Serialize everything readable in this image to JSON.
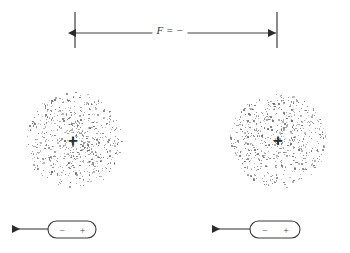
{
  "figure": {
    "background_color": "#ffffff",
    "ink_color": "#3a3a3a",
    "width": 350,
    "height": 253
  },
  "force_annotation": {
    "label": "F = −",
    "arrow_y": 33,
    "left_x": 75,
    "right_x": 277,
    "tick_top_y": 12,
    "tick_bottom_y": 48,
    "label_x": 170,
    "label_y": 30,
    "style": "double-headed-arrow-with-end-ticks"
  },
  "clouds": [
    {
      "name": "left-electron-cloud",
      "cx": 73,
      "cy": 140,
      "radius": 48,
      "dot_count": 620,
      "nucleus_symbol": "+",
      "nucleus_x": 73,
      "nucleus_y": 140,
      "dot_color": "#5a5a5a"
    },
    {
      "name": "right-electron-cloud",
      "cx": 278,
      "cy": 140,
      "radius": 48,
      "dot_count": 620,
      "nucleus_symbol": "+",
      "nucleus_x": 278,
      "nucleus_y": 140,
      "dot_color": "#5a5a5a"
    }
  ],
  "dipoles": [
    {
      "name": "left-dipole",
      "negative_symbol": "−",
      "positive_symbol": "+",
      "capsule_x": 48,
      "capsule_y": 221,
      "capsule_width": 48,
      "capsule_height": 17,
      "arrow_from_x": 48,
      "arrow_to_x": 12,
      "arrow_y": 229,
      "arrow_direction": "left"
    },
    {
      "name": "right-dipole",
      "negative_symbol": "−",
      "positive_symbol": "+",
      "capsule_x": 250,
      "capsule_y": 221,
      "capsule_width": 50,
      "capsule_height": 17,
      "arrow_from_x": 250,
      "arrow_to_x": 212,
      "arrow_y": 229,
      "arrow_direction": "left"
    }
  ]
}
